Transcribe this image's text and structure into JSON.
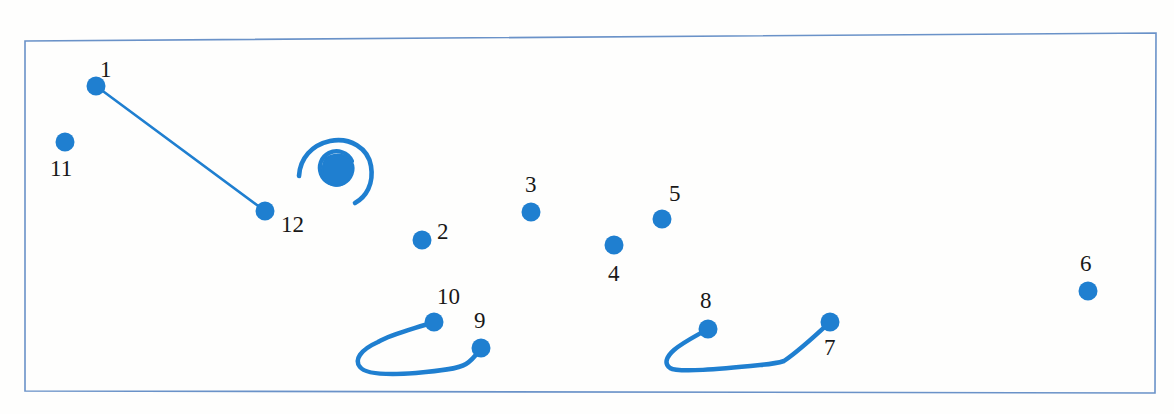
{
  "document": {
    "kind": "hand-drawn-scanned-diagram",
    "title": "Numbered point annotation sheet",
    "background_color": "#fefefd"
  },
  "frame": {
    "name": "border-rectangle",
    "stroke_color": "#6a92c8",
    "stroke_width": 1.6,
    "corners": {
      "top_left": [
        25,
        41
      ],
      "top_right": [
        1156,
        33
      ],
      "bottom_right": [
        1155,
        393
      ],
      "bottom_left": [
        25,
        391
      ]
    }
  },
  "style": {
    "ink_color": "#1f7fd0",
    "ink_color_dark": "#1a6fba",
    "label_color": "#181818",
    "dot_radius": 9.5,
    "stroke_width": 4.5,
    "connector_width": 2.6
  },
  "chart_data": {
    "type": "scatter",
    "xlabel": "",
    "ylabel": "",
    "xlim": [
      25,
      1156
    ],
    "ylim": [
      33,
      393
    ],
    "grid": false,
    "legend": "none",
    "note": "Pixel coordinates in screenshot space; y increases downward.",
    "points": [
      {
        "id": 1,
        "label": "1",
        "x": 96,
        "y": 86,
        "label_x": 100,
        "label_y": 58,
        "label_pos": "above"
      },
      {
        "id": 2,
        "label": "2",
        "x": 422,
        "y": 240,
        "label_x": 437,
        "label_y": 220,
        "label_pos": "upper-right"
      },
      {
        "id": 3,
        "label": "3",
        "x": 531,
        "y": 212,
        "label_x": 525,
        "label_y": 173,
        "label_pos": "above"
      },
      {
        "id": 4,
        "label": "4",
        "x": 614,
        "y": 245,
        "label_x": 608,
        "label_y": 262,
        "label_pos": "below"
      },
      {
        "id": 5,
        "label": "5",
        "x": 662,
        "y": 219,
        "label_x": 669,
        "label_y": 182,
        "label_pos": "above-right"
      },
      {
        "id": 6,
        "label": "6",
        "x": 1088,
        "y": 291,
        "label_x": 1080,
        "label_y": 252,
        "label_pos": "above"
      },
      {
        "id": 7,
        "label": "7",
        "x": 830,
        "y": 322,
        "label_x": 824,
        "label_y": 336,
        "label_pos": "below-right"
      },
      {
        "id": 8,
        "label": "8",
        "x": 708,
        "y": 329,
        "label_x": 700,
        "label_y": 289,
        "label_pos": "above"
      },
      {
        "id": 9,
        "label": "9",
        "x": 481,
        "y": 348,
        "label_x": 474,
        "label_y": 309,
        "label_pos": "above-right"
      },
      {
        "id": 10,
        "label": "10",
        "x": 434,
        "y": 322,
        "label_x": 437,
        "label_y": 285,
        "label_pos": "above"
      },
      {
        "id": 11,
        "label": "11",
        "x": 65,
        "y": 142,
        "label_x": 50,
        "label_y": 157,
        "label_pos": "below"
      },
      {
        "id": 12,
        "label": "12",
        "x": 265,
        "y": 211,
        "label_x": 281,
        "label_y": 213,
        "label_pos": "right"
      }
    ],
    "connectors": [
      {
        "name": "connector-1-to-12",
        "from": 1,
        "to": 12,
        "shape": "straight-line",
        "path": "M 96 86 L 265 211"
      },
      {
        "name": "connector-10-to-9-hook",
        "from": 10,
        "to": 9,
        "shape": "hook-curve",
        "path": "M 434 322 C 410 330 392 334 378 342 C 360 350 354 360 360 367 C 366 375 390 375 416 373 C 440 371 458 369 466 364 C 474 359 477 353 481 348"
      },
      {
        "name": "connector-8-to-7-hook",
        "from": 8,
        "to": 7,
        "shape": "hook-curve",
        "path": "M 708 329 C 694 337 682 343 674 350 C 666 357 664 364 670 368 C 678 373 720 369 760 365 C 772 364 778 363 784 361 C 800 350 816 335 830 322"
      }
    ],
    "marks": [
      {
        "name": "spiral-annotation",
        "type": "spiral-with-blob",
        "center": [
          332,
          172
        ],
        "bounds": [
          298,
          140,
          75,
          62
        ],
        "description": "hand-drawn open spiral curling clockwise inward to a filled ink blob"
      }
    ]
  }
}
